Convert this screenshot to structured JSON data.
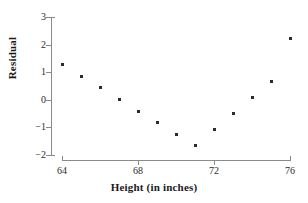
{
  "chart_data": {
    "type": "scatter",
    "title": "",
    "xlabel": "Height (in inches)",
    "ylabel": "Residual",
    "xlim": [
      64,
      76
    ],
    "ylim": [
      -2,
      3
    ],
    "xticks": [
      64,
      68,
      72,
      76
    ],
    "xtick_labels": [
      "64",
      "68",
      "72",
      "76"
    ],
    "yticks": [
      -2,
      -1,
      0,
      1,
      2,
      3
    ],
    "ytick_labels": [
      "−2",
      "−1",
      "0",
      "1",
      "2",
      "3"
    ],
    "grid": false,
    "legend": null,
    "marker": "square",
    "marker_color": "#2a2a33",
    "x": [
      64,
      65,
      66,
      67,
      68,
      69,
      70,
      71,
      72,
      73,
      74,
      75,
      76
    ],
    "y": [
      1.27,
      0.85,
      0.43,
      0.01,
      -0.41,
      -0.83,
      -1.25,
      -1.67,
      -1.07,
      -0.49,
      0.08,
      0.66,
      2.23
    ],
    "points": [
      {
        "x": 64,
        "y": 1.27
      },
      {
        "x": 65,
        "y": 0.85
      },
      {
        "x": 66,
        "y": 0.43
      },
      {
        "x": 67,
        "y": 0.01
      },
      {
        "x": 68,
        "y": -0.41
      },
      {
        "x": 69,
        "y": -0.83
      },
      {
        "x": 70,
        "y": -1.25
      },
      {
        "x": 71,
        "y": -1.67
      },
      {
        "x": 72,
        "y": -1.07
      },
      {
        "x": 73,
        "y": -0.49
      },
      {
        "x": 74,
        "y": 0.08
      },
      {
        "x": 75,
        "y": 0.66
      },
      {
        "x": 76,
        "y": 2.23
      }
    ]
  },
  "axes": {
    "line_color": "#8a8a8a",
    "text_color": "#2b2b2b",
    "title_color": "#1a1a1a"
  }
}
